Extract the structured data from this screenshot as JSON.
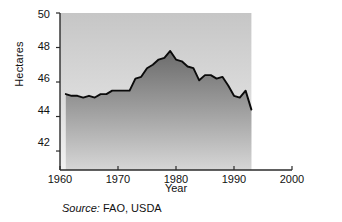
{
  "chart_data": {
    "type": "area",
    "title": "",
    "subtitle": "",
    "xlabel": "Year",
    "ylabel": "Hectares",
    "xlim": [
      1960,
      2000
    ],
    "ylim": [
      40.9,
      50
    ],
    "xticks": [
      1960,
      1970,
      1980,
      1990,
      2000
    ],
    "yticks": [
      42,
      44,
      46,
      48,
      50
    ],
    "grid": false,
    "legend": null,
    "series": [
      {
        "name": "Hectares",
        "x": [
          1961,
          1962,
          1963,
          1964,
          1965,
          1966,
          1967,
          1968,
          1969,
          1970,
          1971,
          1972,
          1973,
          1974,
          1975,
          1976,
          1977,
          1978,
          1979,
          1980,
          1981,
          1982,
          1983,
          1984,
          1985,
          1986,
          1987,
          1988,
          1989,
          1990,
          1991,
          1992,
          1993
        ],
        "values": [
          45.3,
          45.2,
          45.2,
          45.1,
          45.2,
          45.1,
          45.3,
          45.3,
          45.5,
          45.5,
          45.5,
          45.5,
          46.2,
          46.3,
          46.8,
          47.0,
          47.3,
          47.4,
          47.8,
          47.3,
          47.2,
          46.9,
          46.8,
          46.1,
          46.4,
          46.4,
          46.2,
          46.3,
          45.8,
          45.2,
          45.1,
          45.5,
          44.4
        ]
      }
    ],
    "annotations": {
      "source_prefix": "Source:",
      "source_text": "FAO, USDA"
    },
    "colors": {
      "plot_background_top": "#c9c9c9",
      "plot_background_bottom": "#ededed",
      "area_fill_top": "#6f6f6f",
      "area_fill_bottom": "#d2d2d2",
      "line": "#0b0b0b",
      "axis": "#2b2b2b",
      "text": "#111111",
      "page_background": "#ffffff"
    }
  },
  "axes": {
    "y": {
      "label": "Hectares",
      "ticks": [
        {
          "label": "50"
        },
        {
          "label": "48"
        },
        {
          "label": "46"
        },
        {
          "label": "44"
        },
        {
          "label": "42"
        }
      ]
    },
    "x": {
      "label": "Year",
      "ticks": [
        {
          "label": "1960"
        },
        {
          "label": "1970"
        },
        {
          "label": "1980"
        },
        {
          "label": "1990"
        },
        {
          "label": "2000"
        }
      ]
    }
  },
  "caption": {
    "source_prefix": "Source:",
    "source_text": " FAO, USDA"
  }
}
